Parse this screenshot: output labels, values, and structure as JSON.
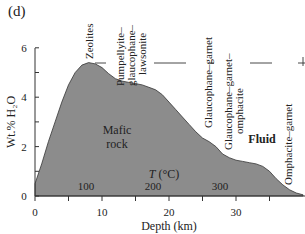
{
  "panel_label": "(d)",
  "chart_data": {
    "type": "area",
    "title": "",
    "xlabel": "Depth (km)",
    "ylabel": "Wt.% H₂O",
    "xlim": [
      0,
      40
    ],
    "ylim": [
      0,
      6
    ],
    "x_ticks": [
      0,
      10,
      20,
      30
    ],
    "x_minor_ticks": [
      5,
      15,
      25,
      35
    ],
    "y_ticks": [
      0,
      2,
      4,
      6
    ],
    "y_minor_ticks": [
      1,
      3,
      5
    ],
    "grid": false,
    "fill_color": "#8c8c8c",
    "series": [
      {
        "name": "Mafic rock H2O content",
        "x": [
          0,
          1,
          2,
          3,
          4,
          5,
          6,
          7,
          8,
          9,
          10,
          11,
          12,
          13,
          14,
          15,
          16,
          17,
          18,
          19,
          20,
          21,
          22,
          23,
          24,
          25,
          26,
          27,
          28,
          29,
          30,
          31,
          32,
          33,
          34,
          35,
          36,
          37,
          38,
          39,
          40
        ],
        "values": [
          0.5,
          1.3,
          2.2,
          3.0,
          3.8,
          4.5,
          5.0,
          5.3,
          5.4,
          5.35,
          5.2,
          4.95,
          4.75,
          4.65,
          4.6,
          4.55,
          4.5,
          4.4,
          4.3,
          4.1,
          3.8,
          3.5,
          3.2,
          2.9,
          2.6,
          2.35,
          2.2,
          2.0,
          1.7,
          1.55,
          1.45,
          1.4,
          1.35,
          1.3,
          1.2,
          1.0,
          0.7,
          0.45,
          0.25,
          0.12,
          0.05
        ]
      }
    ],
    "facies_boundaries": [
      {
        "x": 9.5,
        "y": 5.5
      },
      {
        "x": 16,
        "y": 5.5
      },
      {
        "x": 23,
        "y": 5.5
      },
      {
        "x": 27,
        "y": 5.5
      },
      {
        "x": 33,
        "y": 5.5
      },
      {
        "x": 38.5,
        "y": 5.5
      }
    ],
    "annotations": [
      {
        "text": "Zeolites",
        "orientation": "vertical",
        "x": 9,
        "y": 5.8
      },
      {
        "text": "Pumpellyite– glaucophane– lawsonite",
        "orientation": "vertical",
        "x": 14,
        "y": 5.3
      },
      {
        "text": "Glaucophane–garnet",
        "orientation": "vertical",
        "x": 25.5,
        "y": 4.0
      },
      {
        "text": "Glaucophane–garnet– omphacite",
        "orientation": "vertical",
        "x": 29.5,
        "y": 3.0
      },
      {
        "text": "Omphacite–garnet",
        "orientation": "vertical",
        "x": 39,
        "y": 1.5
      },
      {
        "text": "Mafic rock",
        "x": 12,
        "y": 2.5
      },
      {
        "text": "Fluid",
        "x": 34,
        "y": 2.2
      },
      {
        "text": "T (°C)",
        "x": 19,
        "y": 0.9
      }
    ],
    "temperature_labels": [
      {
        "text": "100",
        "x": 7.5
      },
      {
        "text": "200",
        "x": 17.5
      },
      {
        "text": "300",
        "x": 27.5
      }
    ]
  },
  "labels": {
    "zeolites": "Zeolites",
    "pump1": "Pumpellyite–",
    "pump2": "glaucophane–",
    "pump3": "lawsonite",
    "glgt": "Glaucophane–garnet",
    "glgtom1": "Glaucophane–garnet–",
    "glgtom2": "omphacite",
    "omgt": "Omphacite–garnet",
    "mafic1": "Mafic",
    "mafic2": "rock",
    "fluid": "Fluid",
    "t_label": "T",
    "t_unit": " (°C)",
    "t100": "100",
    "t200": "200",
    "t300": "300",
    "x0": "0",
    "x10": "10",
    "x20": "20",
    "x30": "30",
    "y0": "0",
    "y2": "2",
    "y4": "4",
    "y6": "6",
    "xlabel": "Depth (km)",
    "ylabel": "Wt.% H₂O"
  }
}
